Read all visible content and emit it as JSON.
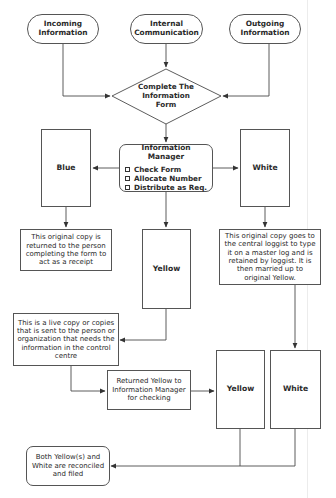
{
  "diagram": {
    "type": "flowchart",
    "line_color": "#4a4a4a",
    "inputs": [
      {
        "id": "incoming",
        "label_line1": "Incoming",
        "label_line2": "Information"
      },
      {
        "id": "internal",
        "label_line1": "Internal",
        "label_line2": "Communication"
      },
      {
        "id": "outgoing",
        "label_line1": "Outgoing",
        "label_line2": "Information"
      }
    ],
    "decision": {
      "line1": "Complete The",
      "line2": "Information",
      "line3": "Form"
    },
    "info_manager": {
      "title": "Information Manager",
      "tasks": [
        "Check Form",
        "Allocate Number",
        "Distribute as Req."
      ]
    },
    "copies": {
      "blue": "Blue",
      "white": "White",
      "yellow": "Yellow",
      "yellow_returned": "Yellow",
      "white_final": "White"
    },
    "notes": {
      "blue_note": "This original copy is returned to the person completing the form to act as a receipt",
      "white_note": "This original copy goes to the central loggist to type it on a master log and is retained by loggist. It is then married up to original Yellow.",
      "yellow_note": "This is a live copy or copies that is sent to the person or organization that needs the information in the control centre",
      "returned_note": "Returned Yellow to Information Manager for checking"
    },
    "final": {
      "label": "Both Yellow(s) and White are reconciled and filed"
    },
    "edges": [
      [
        "incoming",
        "decision"
      ],
      [
        "internal",
        "decision"
      ],
      [
        "outgoing",
        "decision"
      ],
      [
        "decision",
        "info_manager"
      ],
      [
        "info_manager",
        "blue"
      ],
      [
        "info_manager",
        "white"
      ],
      [
        "info_manager",
        "yellow"
      ],
      [
        "blue",
        "blue_note"
      ],
      [
        "white",
        "white_note"
      ],
      [
        "yellow",
        "yellow_note"
      ],
      [
        "yellow_note",
        "returned_note"
      ],
      [
        "returned_note",
        "yellow_returned"
      ],
      [
        "white_note",
        "white_final"
      ],
      [
        "yellow_returned",
        "final"
      ],
      [
        "white_final",
        "final"
      ]
    ]
  }
}
